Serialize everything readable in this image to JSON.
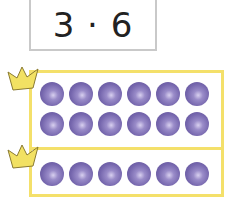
{
  "expression": "3 · 6",
  "colors": {
    "frame": "#f4e06a",
    "crown": "#f2e163",
    "dot": "#7566ad",
    "label_border": "#c9c9c9"
  },
  "groups": [
    {
      "name": "group-1",
      "rows": 2,
      "dots_per_row": 6
    },
    {
      "name": "group-2",
      "rows": 1,
      "dots_per_row": 6
    }
  ],
  "crowns": 2
}
